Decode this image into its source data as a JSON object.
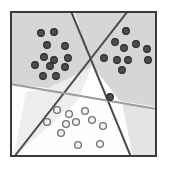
{
  "figure": {
    "kind": "scatter-with-decision-boundaries",
    "width": 171,
    "height": 172,
    "background_color": "#ffffff",
    "frame": {
      "x": 10,
      "y": 11,
      "width": 147,
      "height": 146,
      "stroke_color": "#3a3a3a",
      "stroke_width": 2,
      "fill_color": "#ffffff"
    }
  },
  "regions": [
    {
      "name": "upper-left-shaded-region",
      "fill_color": "#d6d6d6",
      "points": "10,11 72,11 92,65 68,90 10,84"
    },
    {
      "name": "upper-right-shaded-region",
      "fill_color": "#d6d6d6",
      "points": "74,11 157,11 157,107 120,101 92,65"
    },
    {
      "name": "lower-left-white-region",
      "fill_color": "#fdfdfd",
      "points": "10,86 68,92 14,157 10,157"
    },
    {
      "name": "lower-center-white-region",
      "fill_color": "#fefefe",
      "points": "70,92 120,101 131,157 16,157"
    },
    {
      "name": "lower-right-light-wedge",
      "fill_color": "#e4e4e4",
      "points": "157,110 157,157 133,157 122,103"
    },
    {
      "name": "center-pale-wedge",
      "fill_color": "#ededed",
      "points": "92,67 44,90 26,92 14,157 78,100"
    }
  ],
  "boundaries": [
    {
      "name": "boundary-line-major-down-right",
      "color": "#4a4a4a",
      "width": 2,
      "x1": 71,
      "y1": 11,
      "x2": 131,
      "y2": 157
    },
    {
      "name": "boundary-line-major-down-left",
      "color": "#4a4a4a",
      "width": 2,
      "x1": 128,
      "y1": 11,
      "x2": 14,
      "y2": 157
    },
    {
      "name": "boundary-line-gray-horizontal",
      "color": "#9a9a9a",
      "width": 2,
      "x1": 10,
      "y1": 84,
      "x2": 157,
      "y2": 109
    }
  ],
  "chart_data": {
    "type": "scatter",
    "title": "",
    "xlabel": "",
    "ylabel": "",
    "xlim": [
      10,
      157
    ],
    "ylim": [
      11,
      157
    ],
    "grid": false,
    "legend": null,
    "series": [
      {
        "name": "class-a-upper-left",
        "marker": "filled-circle",
        "fill_color": "#4d4d4d",
        "edge_color": "#2b2b2b",
        "radius": 3.4,
        "points": [
          [
            41,
            33
          ],
          [
            54,
            32
          ],
          [
            47,
            45
          ],
          [
            65,
            46
          ],
          [
            44,
            57
          ],
          [
            54,
            60
          ],
          [
            68,
            58
          ],
          [
            35,
            65
          ],
          [
            50,
            66
          ],
          [
            65,
            67
          ],
          [
            43,
            76
          ],
          [
            56,
            76
          ]
        ]
      },
      {
        "name": "class-a-upper-right",
        "marker": "filled-circle",
        "fill_color": "#4d4d4d",
        "edge_color": "#2b2b2b",
        "radius": 3.4,
        "points": [
          [
            126,
            31
          ],
          [
            115,
            42
          ],
          [
            136,
            44
          ],
          [
            124,
            48
          ],
          [
            147,
            49
          ],
          [
            104,
            58
          ],
          [
            117,
            60
          ],
          [
            128,
            60
          ],
          [
            148,
            60
          ],
          [
            122,
            70
          ],
          [
            110,
            97
          ]
        ]
      },
      {
        "name": "class-b-lower",
        "marker": "open-circle",
        "fill_color": "#f4f4f4",
        "edge_color": "#6f6f6f",
        "radius": 3.4,
        "points": [
          [
            57,
            110
          ],
          [
            69,
            114
          ],
          [
            85,
            111
          ],
          [
            47,
            122
          ],
          [
            66,
            124
          ],
          [
            76,
            122
          ],
          [
            92,
            120
          ],
          [
            103,
            126
          ],
          [
            61,
            133
          ],
          [
            78,
            145
          ],
          [
            100,
            144
          ]
        ]
      }
    ]
  }
}
